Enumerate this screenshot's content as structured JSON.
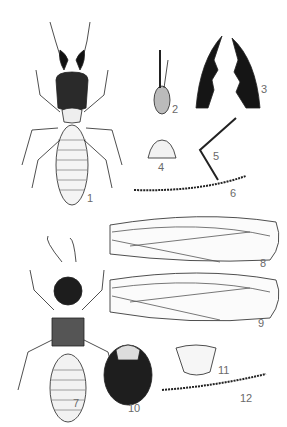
{
  "plate": {
    "subject": "termite anatomy illustration plate",
    "figures": [
      {
        "label": "1",
        "desc": "soldier, dorsal view"
      },
      {
        "label": "2",
        "desc": "head, lateral view"
      },
      {
        "label": "3",
        "desc": "mandibles"
      },
      {
        "label": "4",
        "desc": "labrum"
      },
      {
        "label": "5",
        "desc": "leg"
      },
      {
        "label": "6",
        "desc": "antenna"
      },
      {
        "label": "7",
        "desc": "winged adult (imago), dorsal view"
      },
      {
        "label": "8",
        "desc": "forewing"
      },
      {
        "label": "9",
        "desc": "hindwing"
      },
      {
        "label": "10",
        "desc": "imago head"
      },
      {
        "label": "11",
        "desc": "pronotum"
      },
      {
        "label": "12",
        "desc": "imago antenna"
      }
    ]
  },
  "colors": {
    "ink": "#1a1a1a",
    "background": "#ffffff",
    "label": "#6a6a6a"
  }
}
